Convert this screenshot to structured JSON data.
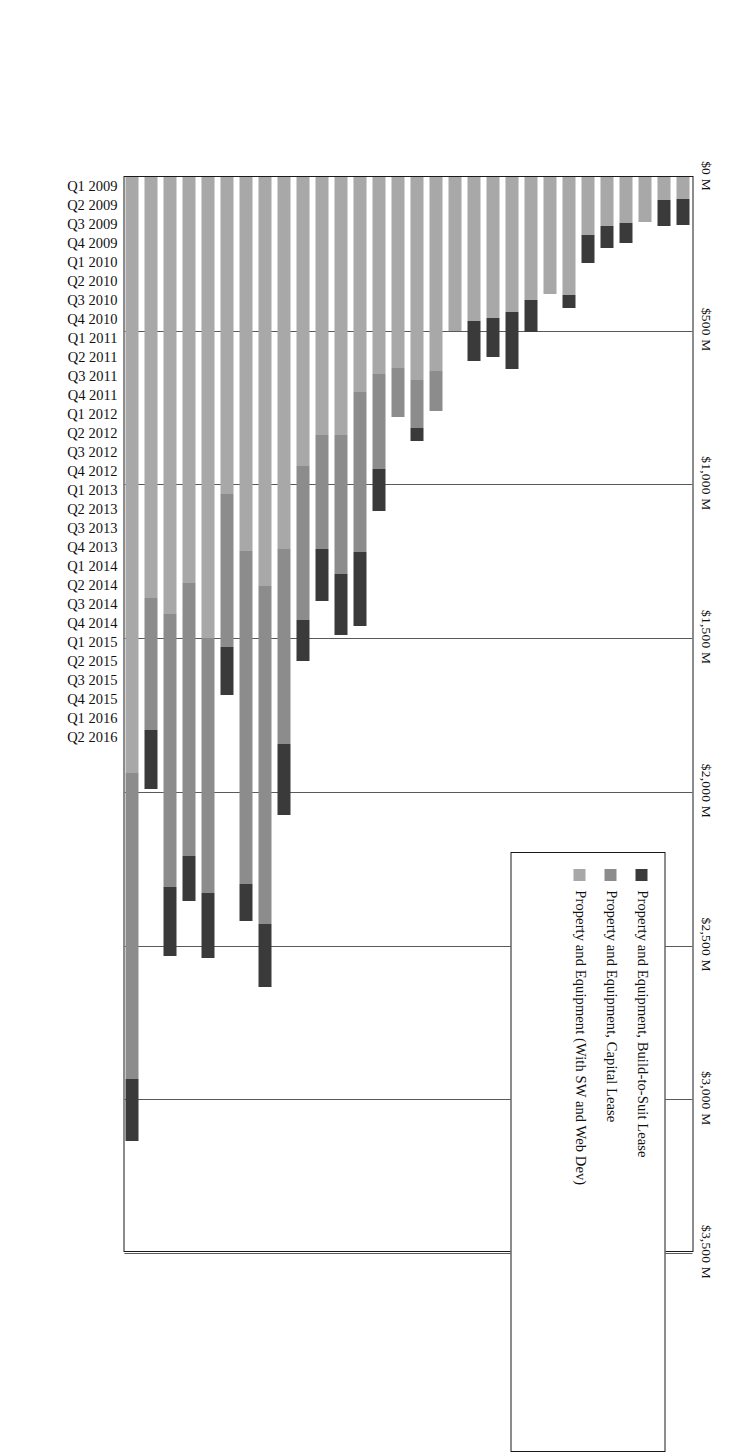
{
  "chart_data": {
    "type": "bar",
    "subtype": "horizontal-stacked",
    "orientation": "rotated-90-ccw",
    "title": "",
    "xlabel": "",
    "ylabel": "",
    "grid": true,
    "legend_position": "upper-right",
    "xlim": [
      0,
      3500
    ],
    "value_unit": "$ Millions",
    "value_ticks": [
      "$0 M",
      "$500 M",
      "$1,000 M",
      "$1,500 M",
      "$2,000 M",
      "$2,500 M",
      "$3,000 M",
      "$3,500 M"
    ],
    "value_tick_numbers": [
      0,
      500,
      1000,
      1500,
      2000,
      2500,
      3000,
      3500
    ],
    "categories": [
      "Q1 2009",
      "Q2 2009",
      "Q3 2009",
      "Q4 2009",
      "Q1 2010",
      "Q2 2010",
      "Q3 2010",
      "Q4 2010",
      "Q1 2011",
      "Q2 2011",
      "Q3 2011",
      "Q4 2011",
      "Q1 2012",
      "Q2 2012",
      "Q3 2012",
      "Q4 2012",
      "Q1 2013",
      "Q2 2013",
      "Q3 2013",
      "Q4 2013",
      "Q1 2014",
      "Q2 2014",
      "Q3 2014",
      "Q4 2014",
      "Q1 2015",
      "Q2 2015",
      "Q3 2015",
      "Q4 2015",
      "Q1 2016",
      "Q2 2016"
    ],
    "series": [
      {
        "name": "Property and Equipment (With SW and Web Dev)",
        "key": "base",
        "color": "#a8a8a8",
        "values": [
          70,
          75,
          145,
          150,
          160,
          190,
          385,
          380,
          400,
          440,
          460,
          470,
          500,
          630,
          660,
          620,
          640,
          700,
          840,
          840,
          940,
          1210,
          1330,
          1215,
          1030,
          1500,
          1320,
          1420,
          1370,
          1940
        ]
      },
      {
        "name": "Property and Equipment, Capital Lease",
        "key": "capital",
        "color": "#8c8c8c",
        "values": [
          0,
          0,
          0,
          0,
          0,
          0,
          0,
          0,
          0,
          0,
          0,
          0,
          0,
          130,
          155,
          160,
          310,
          520,
          450,
          370,
          500,
          635,
          1100,
          1085,
          500,
          830,
          890,
          890,
          430,
          995
        ]
      },
      {
        "name": "Property and Equipment, Build-to-Suit Lease",
        "key": "buildtosuit",
        "color": "#3a3a3a",
        "values": [
          85,
          85,
          0,
          65,
          70,
          90,
          40,
          0,
          105,
          185,
          125,
          130,
          0,
          0,
          45,
          0,
          135,
          240,
          200,
          170,
          135,
          230,
          205,
          120,
          155,
          210,
          145,
          225,
          190,
          200
        ]
      }
    ],
    "totals": [
      155,
      160,
      145,
      215,
      230,
      280,
      425,
      380,
      505,
      625,
      585,
      600,
      500,
      760,
      860,
      780,
      1085,
      1460,
      1490,
      1380,
      1575,
      2075,
      2635,
      2420,
      1960,
      2540,
      2355,
      2535,
      1990,
      3135
    ]
  },
  "legend": {
    "items": [
      {
        "label": "Property and Equipment, Build-to-Suit Lease",
        "color": "#3a3a3a"
      },
      {
        "label": "Property and Equipment, Capital Lease",
        "color": "#8c8c8c"
      },
      {
        "label": "Property and Equipment (With SW and Web Dev)",
        "color": "#a8a8a8"
      }
    ]
  },
  "colors": {
    "build_to_suit": "#3a3a3a",
    "capital_lease": "#8c8c8c",
    "property_equipment": "#a8a8a8",
    "axis": "#1a1a1a",
    "gridline": "#5a5a5a",
    "background": "#ffffff"
  }
}
